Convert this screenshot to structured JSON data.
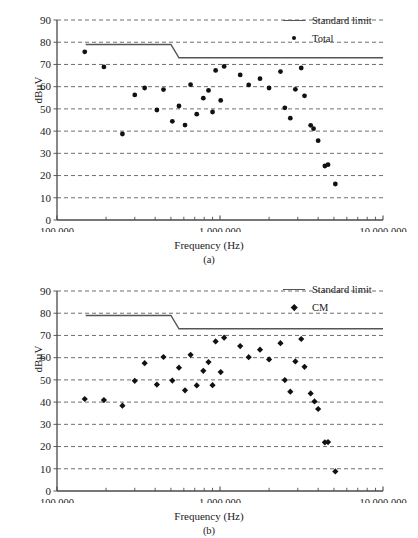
{
  "figure": {
    "panels": [
      {
        "id": "a",
        "caption": "(a)",
        "xlabel": "Frequency (Hz)",
        "ylabel": "dBµV",
        "legend": [
          {
            "label": "Standard limit",
            "key": "line",
            "color": "#555555"
          },
          {
            "label": "Total",
            "key": "circle",
            "color": "#111111"
          }
        ],
        "ytick_labels": [
          "90",
          "80",
          "70",
          "60",
          "50",
          "40",
          "30",
          "20",
          "10",
          "0"
        ],
        "xtick_labels": [
          "100 000",
          "1 000 000",
          "10 000 000"
        ]
      },
      {
        "id": "b",
        "caption": "(b)",
        "xlabel": "Frequency (Hz)",
        "ylabel": "dBµV",
        "legend": [
          {
            "label": "Standard limit",
            "key": "line",
            "color": "#555555"
          },
          {
            "label": "CM",
            "key": "diamond",
            "color": "#111111"
          }
        ],
        "ytick_labels": [
          "90",
          "80",
          "70",
          "60",
          "50",
          "40",
          "30",
          "20",
          "10",
          "0"
        ],
        "xtick_labels": [
          "100 000",
          "1 000 000",
          "10 000 000"
        ]
      }
    ]
  },
  "chart_data": [
    {
      "type": "scatter",
      "panel": "(a)",
      "title": "",
      "xlabel": "Frequency (Hz)",
      "ylabel": "dBµV",
      "xscale": "log",
      "xlim": [
        100000,
        10000000
      ],
      "ylim": [
        0,
        90
      ],
      "ytick_step": 10,
      "grid": "horizontal-dashed",
      "legend_position": "top-right",
      "series": [
        {
          "name": "Standard limit",
          "type": "line",
          "color": "#555555",
          "points": [
            {
              "x": 150000,
              "y": 79
            },
            {
              "x": 500000,
              "y": 79
            },
            {
              "x": 560000,
              "y": 73
            },
            {
              "x": 10000000,
              "y": 73
            }
          ]
        },
        {
          "name": "Total",
          "type": "scatter",
          "marker": "circle",
          "color": "#111111",
          "points": [
            {
              "x": 148000,
              "y": 75.7
            },
            {
              "x": 194000,
              "y": 68.9
            },
            {
              "x": 252000,
              "y": 38.7
            },
            {
              "x": 300000,
              "y": 56.3
            },
            {
              "x": 345000,
              "y": 59.4
            },
            {
              "x": 410000,
              "y": 49.5
            },
            {
              "x": 450000,
              "y": 58.7
            },
            {
              "x": 510000,
              "y": 44.4
            },
            {
              "x": 560000,
              "y": 51.3
            },
            {
              "x": 610000,
              "y": 42.7
            },
            {
              "x": 660000,
              "y": 60.9
            },
            {
              "x": 720000,
              "y": 47.6
            },
            {
              "x": 790000,
              "y": 54.8
            },
            {
              "x": 850000,
              "y": 58.3
            },
            {
              "x": 900000,
              "y": 48.6
            },
            {
              "x": 940000,
              "y": 67.3
            },
            {
              "x": 1010000,
              "y": 53.8
            },
            {
              "x": 1060000,
              "y": 69.1
            },
            {
              "x": 1330000,
              "y": 65.3
            },
            {
              "x": 1500000,
              "y": 60.8
            },
            {
              "x": 1760000,
              "y": 63.6
            },
            {
              "x": 2000000,
              "y": 59.4
            },
            {
              "x": 2350000,
              "y": 66.8
            },
            {
              "x": 2500000,
              "y": 50.5
            },
            {
              "x": 2700000,
              "y": 45.8
            },
            {
              "x": 2900000,
              "y": 58.8
            },
            {
              "x": 3150000,
              "y": 68.4
            },
            {
              "x": 3300000,
              "y": 55.9
            },
            {
              "x": 3600000,
              "y": 42.6
            },
            {
              "x": 3750000,
              "y": 41.1
            },
            {
              "x": 4000000,
              "y": 35.7
            },
            {
              "x": 4400000,
              "y": 24.3
            },
            {
              "x": 4600000,
              "y": 24.9
            },
            {
              "x": 5100000,
              "y": 16.2
            }
          ]
        }
      ]
    },
    {
      "type": "scatter",
      "panel": "(b)",
      "title": "",
      "xlabel": "Frequency (Hz)",
      "ylabel": "dBµV",
      "xscale": "log",
      "xlim": [
        100000,
        10000000
      ],
      "ylim": [
        0,
        90
      ],
      "ytick_step": 10,
      "grid": "horizontal-dashed",
      "legend_position": "top-right",
      "series": [
        {
          "name": "Standard limit",
          "type": "line",
          "color": "#555555",
          "points": [
            {
              "x": 150000,
              "y": 79
            },
            {
              "x": 500000,
              "y": 79
            },
            {
              "x": 560000,
              "y": 73
            },
            {
              "x": 10000000,
              "y": 73
            }
          ]
        },
        {
          "name": "CM",
          "type": "scatter",
          "marker": "diamond",
          "color": "#111111",
          "points": [
            {
              "x": 148000,
              "y": 41.4
            },
            {
              "x": 194000,
              "y": 40.9
            },
            {
              "x": 252000,
              "y": 38.4
            },
            {
              "x": 300000,
              "y": 49.6
            },
            {
              "x": 345000,
              "y": 57.5
            },
            {
              "x": 410000,
              "y": 47.9
            },
            {
              "x": 450000,
              "y": 60.3
            },
            {
              "x": 510000,
              "y": 49.7
            },
            {
              "x": 560000,
              "y": 55.5
            },
            {
              "x": 610000,
              "y": 45.3
            },
            {
              "x": 660000,
              "y": 61.3
            },
            {
              "x": 720000,
              "y": 47.5
            },
            {
              "x": 790000,
              "y": 54.1
            },
            {
              "x": 850000,
              "y": 58.0
            },
            {
              "x": 900000,
              "y": 47.6
            },
            {
              "x": 940000,
              "y": 67.3
            },
            {
              "x": 1010000,
              "y": 53.5
            },
            {
              "x": 1060000,
              "y": 69.0
            },
            {
              "x": 1330000,
              "y": 65.2
            },
            {
              "x": 1500000,
              "y": 60.2
            },
            {
              "x": 1760000,
              "y": 63.6
            },
            {
              "x": 2000000,
              "y": 59.2
            },
            {
              "x": 2350000,
              "y": 66.5
            },
            {
              "x": 2500000,
              "y": 49.9
            },
            {
              "x": 2700000,
              "y": 44.7
            },
            {
              "x": 2900000,
              "y": 58.3
            },
            {
              "x": 3150000,
              "y": 68.4
            },
            {
              "x": 3300000,
              "y": 55.9
            },
            {
              "x": 3600000,
              "y": 43.9
            },
            {
              "x": 3800000,
              "y": 40.3
            },
            {
              "x": 4000000,
              "y": 36.9
            },
            {
              "x": 4400000,
              "y": 21.9
            },
            {
              "x": 4600000,
              "y": 22.0
            },
            {
              "x": 5100000,
              "y": 8.8
            }
          ]
        }
      ]
    }
  ]
}
